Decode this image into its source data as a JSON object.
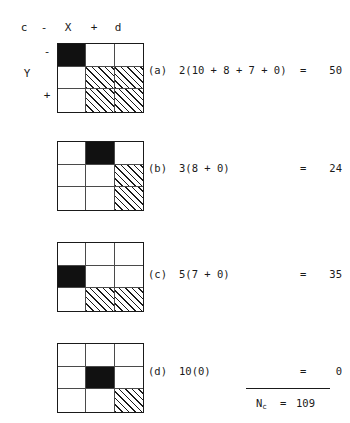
{
  "figure": {
    "axes": {
      "top_left_label": "c",
      "top_minus": "-",
      "x_label": "X",
      "top_plus": "+",
      "top_right_label": "d",
      "left_minus": "-",
      "y_label": "Y",
      "left_plus": "+"
    },
    "panels": [
      {
        "tag": "(a)",
        "expression": "2(10 + 8 + 7 + 0)",
        "equals": "=",
        "value": "50",
        "cells": [
          "black",
          "empty",
          "empty",
          "empty",
          "hatch",
          "hatch",
          "empty",
          "hatch",
          "hatch"
        ]
      },
      {
        "tag": "(b)",
        "expression": "3(8 + 0)",
        "equals": "=",
        "value": "24",
        "cells": [
          "empty",
          "black",
          "empty",
          "empty",
          "empty",
          "hatch",
          "empty",
          "empty",
          "hatch"
        ]
      },
      {
        "tag": "(c)",
        "expression": "5(7 + 0)",
        "equals": "=",
        "value": "35",
        "cells": [
          "empty",
          "empty",
          "empty",
          "black",
          "empty",
          "empty",
          "empty",
          "hatch",
          "hatch"
        ]
      },
      {
        "tag": "(d)",
        "expression": "10(0)",
        "equals": "=",
        "value": "0",
        "cells": [
          "empty",
          "empty",
          "empty",
          "empty",
          "black",
          "empty",
          "empty",
          "empty",
          "hatch"
        ]
      }
    ],
    "total": {
      "symbol": "N",
      "subscript": "c",
      "equals": "=",
      "value": "109"
    },
    "colors": {
      "ink": "#1a1a1a",
      "grid_line": "#4a4a4a",
      "black_cell": "#111111",
      "background": "#ffffff"
    }
  }
}
